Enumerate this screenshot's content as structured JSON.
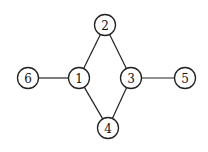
{
  "diagram": {
    "type": "undirected-graph",
    "colors": {
      "stroke": "#222222",
      "fill": "#ffffff",
      "text": "#111111"
    },
    "node_radius": 10.5,
    "nodes": [
      {
        "id": "1",
        "label": "1",
        "x": 79,
        "y": 78
      },
      {
        "id": "2",
        "label": "2",
        "x": 105,
        "y": 25
      },
      {
        "id": "3",
        "label": "3",
        "x": 131,
        "y": 78
      },
      {
        "id": "4",
        "label": "4",
        "x": 108,
        "y": 128
      },
      {
        "id": "5",
        "label": "5",
        "x": 185,
        "y": 78
      },
      {
        "id": "6",
        "label": "6",
        "x": 28,
        "y": 78
      }
    ],
    "edges": [
      {
        "from": "6",
        "to": "1"
      },
      {
        "from": "1",
        "to": "2"
      },
      {
        "from": "1",
        "to": "4"
      },
      {
        "from": "2",
        "to": "3"
      },
      {
        "from": "4",
        "to": "3"
      },
      {
        "from": "3",
        "to": "5"
      }
    ]
  }
}
